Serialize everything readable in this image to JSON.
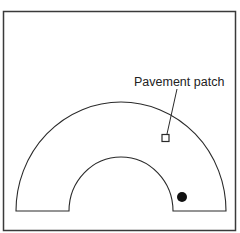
{
  "diagram": {
    "colors": {
      "background": "#ffffff",
      "stroke": "#2a2a2a",
      "frame": "#3a3a3a",
      "dot": "#111111"
    },
    "frame": {
      "x": 3.5,
      "y": 11.5,
      "width": 232,
      "height": 219
    },
    "road": {
      "shape": "half-annulus",
      "center": [
        121,
        211
      ],
      "outer_radius": [
        105,
        109
      ],
      "inner_radius": [
        52,
        54
      ],
      "baseline_y": 211
    },
    "annotations": [
      {
        "label": "Pavement patch",
        "text_position": [
          134,
          86
        ],
        "leader_start": [
          177,
          89
        ],
        "leader_end": [
          167,
          134
        ],
        "marker": "square",
        "marker_box": {
          "x": 162,
          "y": 134.5,
          "width": 7,
          "height": 7
        }
      }
    ],
    "markers": [
      {
        "type": "filled-circle",
        "center": [
          182,
          197
        ],
        "radius": 5
      }
    ]
  }
}
